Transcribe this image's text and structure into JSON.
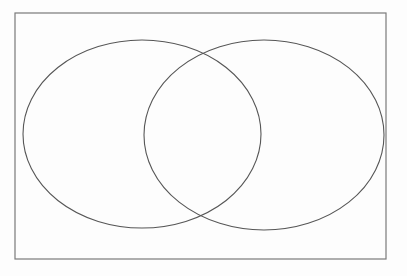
{
  "diagram": {
    "type": "venn",
    "background_color": "#fdfdfd",
    "frame": {
      "x": 15,
      "y": 13,
      "width": 371,
      "height": 246,
      "stroke": "#7a7a7a",
      "stroke_width": 1.2,
      "fill": "none"
    },
    "left_ellipse": {
      "cx": 142,
      "cy": 134,
      "rx": 119,
      "ry": 94,
      "stroke": "#565656",
      "stroke_width": 1.1,
      "fill": "none"
    },
    "right_ellipse": {
      "cx": 264,
      "cy": 135,
      "rx": 120,
      "ry": 95,
      "stroke": "#565656",
      "stroke_width": 1.1,
      "fill": "none"
    }
  }
}
